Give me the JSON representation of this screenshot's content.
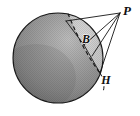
{
  "figure": {
    "background_color": "#ffffff",
    "width": 140,
    "height": 116
  },
  "sphere": {
    "name": "shaded-sphere",
    "center_x": 58,
    "center_y": 58,
    "radius": 45,
    "fill_color": "#8d8d8d",
    "highlight_color": "#b4b4b4",
    "shadow_color": "#6f6f6f",
    "outline_color": "#1a1a1a",
    "texture": "halftone-dots"
  },
  "lune": {
    "name": "lighter-cap-region",
    "fill_color": "#c8c8c8",
    "description": "lighter spherical lune between dashed great circle and right rim"
  },
  "great_circle": {
    "name": "dashed-great-circle-arc",
    "style": "dashed",
    "color": "#141414",
    "dash_pattern": "4 3"
  },
  "points": [
    {
      "id": "P",
      "label": "P",
      "x": 120,
      "y": 13,
      "label_x": 127,
      "label_y": 12,
      "font_size": 13,
      "external": true
    },
    {
      "id": "B",
      "label": "B",
      "x": 88,
      "y": 43,
      "label_x": 86,
      "label_y": 40,
      "font_size": 12,
      "external": false
    },
    {
      "id": "H",
      "label": "H",
      "x": 100,
      "y": 73,
      "label_x": 106,
      "label_y": 81,
      "font_size": 12,
      "external": false
    }
  ],
  "rays": [
    {
      "name": "ray-P-to-arc-top",
      "from": "P",
      "x1": 120,
      "y1": 13,
      "x2": 66,
      "y2": 21
    },
    {
      "name": "ray-P-to-B",
      "from": "P",
      "x1": 120,
      "y1": 13,
      "x2": 84,
      "y2": 45
    },
    {
      "name": "ray-P-to-H",
      "from": "P",
      "x1": 120,
      "y1": 13,
      "x2": 100,
      "y2": 73
    },
    {
      "name": "ray-P-to-rim",
      "from": "P",
      "x1": 120,
      "y1": 13,
      "x2": 92,
      "y2": 56
    }
  ],
  "chords": [
    {
      "name": "chord-arc-top-to-B",
      "x1": 66,
      "y1": 21,
      "x2": 84,
      "y2": 45
    },
    {
      "name": "chord-B-to-H",
      "x1": 84,
      "y1": 45,
      "x2": 100,
      "y2": 73
    }
  ],
  "line_color": "#141414",
  "line_width": 0.9
}
